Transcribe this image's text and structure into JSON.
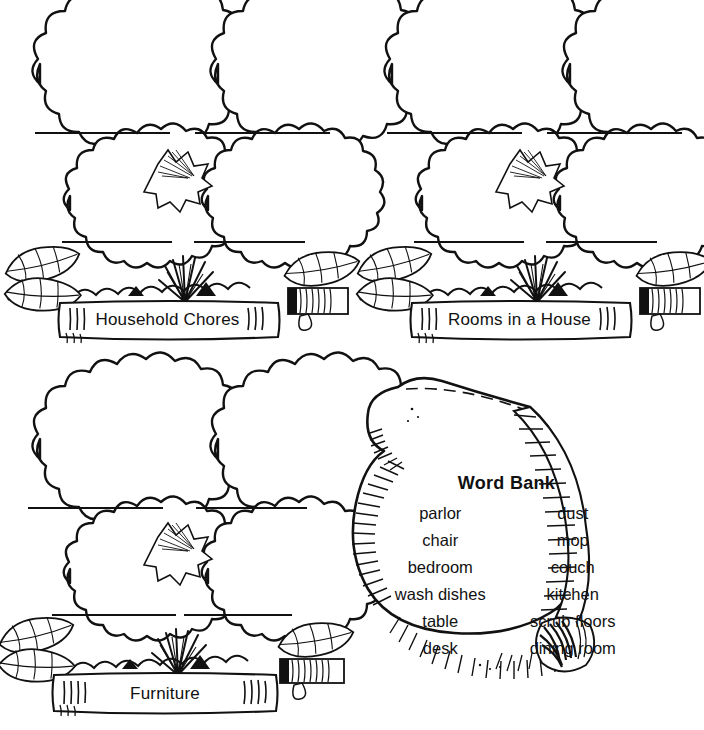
{
  "worksheet": {
    "type": "word-sort-worksheet",
    "background_color": "#ffffff",
    "ink_color": "#111111"
  },
  "clusters": [
    {
      "id": "household-chores",
      "label": "Household Chores",
      "blank_lines": 4,
      "bush_count": 4
    },
    {
      "id": "rooms-in-a-house",
      "label": "Rooms in a House",
      "blank_lines": 4,
      "bush_count": 4
    },
    {
      "id": "furniture",
      "label": "Furniture",
      "blank_lines": 4,
      "bush_count": 4
    }
  ],
  "word_bank": {
    "title": "Word Bank",
    "column_left": [
      "parlor",
      "chair",
      "bedroom",
      "wash dishes",
      "table",
      "desk"
    ],
    "column_right": [
      "dust",
      "mop",
      "couch",
      "kitchen",
      "scrub floors",
      "dining room"
    ],
    "words_in_reading_order": [
      "parlor",
      "dust",
      "chair",
      "mop",
      "bedroom",
      "couch",
      "wash dishes",
      "kitchen",
      "table",
      "scrub floors",
      "desk",
      "dining room"
    ]
  }
}
